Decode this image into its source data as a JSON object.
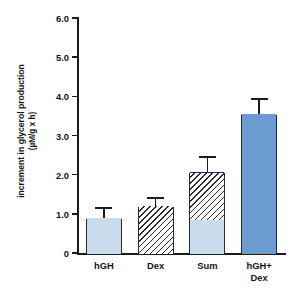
{
  "chart_data": {
    "type": "bar",
    "title": "",
    "subtitle": "",
    "xlabel": "",
    "ylabel": "increment in glycerol production",
    "ylabel_units": "(µM/g x h)",
    "categories": [
      "hGH",
      "Dex",
      "Sum",
      "hGH+\nDex"
    ],
    "category_lines": [
      [
        "hGH"
      ],
      [
        "Dex"
      ],
      [
        "Sum"
      ],
      [
        "hGH+",
        "Dex"
      ]
    ],
    "ylim": [
      0,
      6.0
    ],
    "ytick_labels": [
      "6.0",
      "5.0",
      "4.0",
      "3.0",
      "2.0",
      "1.0",
      "0"
    ],
    "ytick_values": [
      6.0,
      5.0,
      4.0,
      3.0,
      2.0,
      1.0,
      0
    ],
    "grid": false,
    "legend": "none",
    "values": [
      0.87,
      1.17,
      2.05,
      3.52
    ],
    "errors_upper": [
      0.3,
      0.26,
      0.42,
      0.44
    ],
    "bars": [
      {
        "category": "hGH",
        "total": 0.87,
        "error_upper": 0.3,
        "error_top": 1.17,
        "segments": [
          {
            "from": 0,
            "to": 0.87,
            "fill": "solid-light"
          }
        ]
      },
      {
        "category": "Dex",
        "total": 1.17,
        "error_upper": 0.26,
        "error_top": 1.43,
        "segments": [
          {
            "from": 0,
            "to": 1.17,
            "fill": "hatch"
          }
        ]
      },
      {
        "category": "Sum",
        "total": 2.05,
        "error_upper": 0.42,
        "error_top": 2.47,
        "segments": [
          {
            "from": 0,
            "to": 0.87,
            "fill": "solid-light"
          },
          {
            "from": 0.87,
            "to": 2.05,
            "fill": "hatch"
          }
        ]
      },
      {
        "category": "hGH+Dex",
        "total": 3.52,
        "error_upper": 0.44,
        "error_top": 3.96,
        "segments": [
          {
            "from": 0,
            "to": 3.52,
            "fill": "solid-mid"
          }
        ]
      }
    ],
    "colors": {
      "solid_light": "#c9dcec",
      "solid_mid": "#6b9bd1",
      "hatch_line": "#2a2a2a",
      "hatch_background": "#ffffff",
      "bar_border": "#1c2c46",
      "axis": "#1b1b1b",
      "text": "#141414",
      "background": "#ffffff"
    }
  }
}
